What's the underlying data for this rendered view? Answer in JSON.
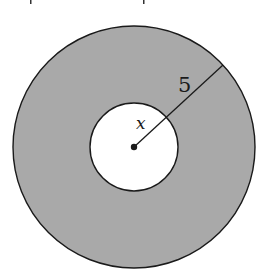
{
  "figure": {
    "type": "annulus",
    "labels": {
      "outer_radius": "5",
      "inner_radius": "x"
    },
    "colors": {
      "ring_fill": "#a9a9a9",
      "inner_fill": "#ffffff",
      "stroke": "#1a1a1a",
      "background": "#ffffff"
    }
  }
}
